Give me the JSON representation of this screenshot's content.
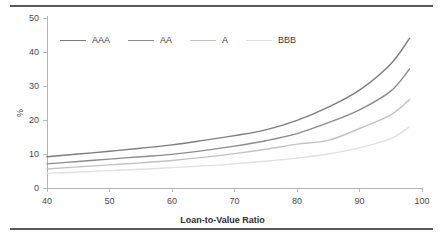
{
  "chart_data": {
    "type": "line",
    "title": "",
    "subtitle": "",
    "xlabel": "Loan-to-Value Ratio",
    "ylabel": "%",
    "xlim": [
      40,
      100
    ],
    "ylim": [
      0,
      50
    ],
    "xticks": [
      40,
      50,
      60,
      70,
      80,
      90,
      100
    ],
    "xtick_labels": [
      "40",
      "50",
      "60",
      "70",
      "80",
      "90",
      "100"
    ],
    "yticks": [
      0,
      10,
      20,
      30,
      40,
      50
    ],
    "ytick_labels": [
      "0",
      "10",
      "20",
      "30",
      "40",
      "50"
    ],
    "grid": false,
    "legend_position": "top-left-inside",
    "x": [
      40,
      45,
      50,
      55,
      60,
      65,
      70,
      75,
      80,
      85,
      90,
      95,
      98
    ],
    "series": [
      {
        "name": "AAA",
        "color": "#7d7d7d",
        "values": [
          9.2,
          10.0,
          10.8,
          11.7,
          12.7,
          14.0,
          15.4,
          17.1,
          19.9,
          23.8,
          28.8,
          36.5,
          44.0
        ]
      },
      {
        "name": "AA",
        "color": "#8c8c8c",
        "values": [
          7.1,
          7.8,
          8.5,
          9.2,
          9.9,
          11.0,
          12.3,
          13.9,
          16.0,
          19.2,
          23.0,
          28.5,
          35.0
        ]
      },
      {
        "name": "A",
        "color": "#c2c2c2",
        "values": [
          5.6,
          6.2,
          6.8,
          7.4,
          8.1,
          9.0,
          10.1,
          11.4,
          12.9,
          14.0,
          17.5,
          21.5,
          26.0
        ]
      },
      {
        "name": "BBB",
        "color": "#e0e0e0",
        "values": [
          4.3,
          4.7,
          5.1,
          5.5,
          6.0,
          6.5,
          7.1,
          7.9,
          8.8,
          10.0,
          11.8,
          14.5,
          18.0
        ]
      }
    ]
  },
  "figure": {
    "top_rule": "",
    "bottom_rule": ""
  },
  "legend": {
    "items": [
      {
        "label": "AAA"
      },
      {
        "label": "AA"
      },
      {
        "label": "A"
      },
      {
        "label": "BBB"
      }
    ]
  },
  "colors": {
    "axis": "#b3b3b3",
    "tick_text": "#4a4a4a",
    "rule": "#5a5a5a",
    "background": "#ffffff"
  }
}
